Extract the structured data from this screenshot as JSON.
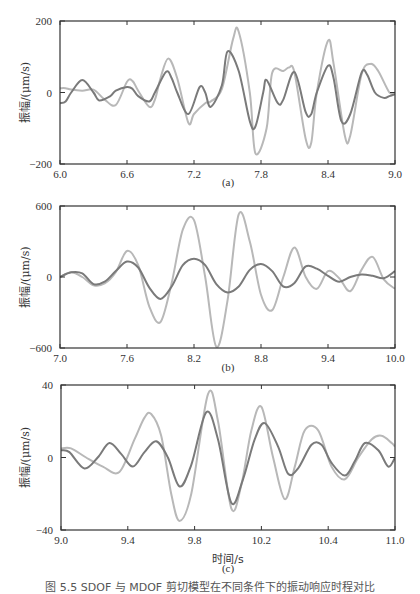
{
  "figure": {
    "caption": "图 5.5  SDOF 与 MDOF 剪切模型在不同条件下的振动响应时程对比",
    "xlabel_shared": "时间/s",
    "colors": {
      "series_dark": "#7a7a7a",
      "series_light": "#b8b8b8",
      "axis": "#333333"
    }
  },
  "chart_data": [
    {
      "type": "line",
      "panel_label": "(a)",
      "title": "",
      "xlabel": "",
      "ylabel": "振幅/(μm/s)",
      "xlim": [
        6.0,
        9.0
      ],
      "ylim": [
        -200,
        200
      ],
      "xticks": [
        6.0,
        6.6,
        7.2,
        7.8,
        8.4,
        9.0
      ],
      "xtick_labels": [
        "6.0",
        "6.6",
        "7.2",
        "7.8",
        "8.4",
        "9.0"
      ],
      "yticks": [
        -200,
        0,
        200
      ],
      "ytick_labels": [
        "-200",
        "0",
        "200"
      ],
      "grid": false,
      "legend": null,
      "series": [
        {
          "name": "dark",
          "x": [
            6.0,
            6.05,
            6.1,
            6.2,
            6.3,
            6.35,
            6.45,
            6.5,
            6.6,
            6.65,
            6.7,
            6.8,
            6.85,
            6.95,
            7.0,
            7.05,
            7.15,
            7.25,
            7.3,
            7.35,
            7.45,
            7.5,
            7.6,
            7.7,
            7.75,
            7.82,
            7.85,
            7.95,
            8.0,
            8.1,
            8.2,
            8.25,
            8.3,
            8.4,
            8.45,
            8.52,
            8.6,
            8.7,
            8.75,
            8.82,
            8.9,
            8.95,
            9.0
          ],
          "y": [
            -30,
            -25,
            0,
            35,
            0,
            -22,
            -10,
            5,
            15,
            10,
            -10,
            -25,
            0,
            58,
            40,
            0,
            -60,
            15,
            0,
            -40,
            20,
            115,
            60,
            -80,
            -95,
            0,
            35,
            -30,
            -20,
            57,
            -55,
            -60,
            0,
            75,
            40,
            -80,
            -60,
            55,
            50,
            0,
            -15,
            -10,
            -5
          ]
        },
        {
          "name": "light",
          "x": [
            6.0,
            6.05,
            6.1,
            6.2,
            6.3,
            6.4,
            6.5,
            6.6,
            6.65,
            6.7,
            6.8,
            6.85,
            6.9,
            6.97,
            7.05,
            7.15,
            7.2,
            7.3,
            7.35,
            7.45,
            7.55,
            7.6,
            7.7,
            7.75,
            7.85,
            7.9,
            8.0,
            8.05,
            8.1,
            8.2,
            8.25,
            8.3,
            8.4,
            8.45,
            8.55,
            8.6,
            8.7,
            8.78,
            8.85,
            8.95,
            9.0
          ],
          "y": [
            12,
            12,
            8,
            5,
            8,
            -20,
            -35,
            30,
            32,
            5,
            -40,
            -20,
            40,
            95,
            40,
            -85,
            -60,
            -30,
            -25,
            10,
            150,
            170,
            0,
            -170,
            -100,
            55,
            60,
            70,
            55,
            -130,
            -140,
            0,
            145,
            80,
            -120,
            -120,
            50,
            80,
            60,
            0,
            0
          ]
        }
      ]
    },
    {
      "type": "line",
      "panel_label": "(b)",
      "title": "",
      "xlabel": "",
      "ylabel": "振幅/(μm/s)",
      "xlim": [
        7.0,
        10.0
      ],
      "ylim": [
        -600,
        600
      ],
      "xticks": [
        7.0,
        7.6,
        8.2,
        8.8,
        9.4,
        10.0
      ],
      "xtick_labels": [
        "7.0",
        "7.6",
        "8.2",
        "8.8",
        "9.4",
        "10.0"
      ],
      "yticks": [
        -600,
        0,
        600
      ],
      "ytick_labels": [
        "-600",
        "0",
        "600"
      ],
      "grid": false,
      "legend": null,
      "series": [
        {
          "name": "dark",
          "x": [
            7.0,
            7.1,
            7.2,
            7.3,
            7.4,
            7.5,
            7.6,
            7.7,
            7.8,
            7.9,
            8.0,
            8.1,
            8.2,
            8.3,
            8.4,
            8.5,
            8.6,
            8.7,
            8.8,
            8.9,
            9.0,
            9.1,
            9.2,
            9.3,
            9.4,
            9.5,
            9.6,
            9.7,
            9.8,
            9.9,
            10.0
          ],
          "y": [
            0,
            40,
            30,
            -60,
            -40,
            50,
            130,
            80,
            -90,
            -185,
            -80,
            100,
            155,
            100,
            -60,
            -130,
            -80,
            60,
            110,
            50,
            -80,
            -50,
            90,
            70,
            10,
            -40,
            0,
            20,
            10,
            -10,
            50
          ]
        },
        {
          "name": "light",
          "x": [
            7.0,
            7.1,
            7.2,
            7.3,
            7.4,
            7.5,
            7.6,
            7.7,
            7.8,
            7.9,
            8.0,
            8.1,
            8.2,
            8.3,
            8.4,
            8.5,
            8.6,
            8.7,
            8.8,
            8.9,
            9.0,
            9.1,
            9.2,
            9.3,
            9.4,
            9.5,
            9.6,
            9.7,
            9.8,
            9.9,
            10.0
          ],
          "y": [
            0,
            40,
            0,
            -70,
            -55,
            40,
            220,
            100,
            -250,
            -380,
            -50,
            400,
            480,
            0,
            -590,
            -200,
            530,
            300,
            -150,
            -280,
            0,
            250,
            0,
            -100,
            50,
            -10,
            -120,
            60,
            170,
            -20,
            -100
          ]
        }
      ]
    },
    {
      "type": "line",
      "panel_label": "(c)",
      "title": "",
      "xlabel": "时间/s",
      "ylabel": "振幅/(μm/s)",
      "xlim": [
        9.0,
        11.0
      ],
      "ylim": [
        -40,
        40
      ],
      "xticks": [
        9.0,
        9.4,
        9.8,
        10.2,
        10.4,
        11.0
      ],
      "xtick_labels": [
        "9.0",
        "9.4",
        "9.8",
        "10.2",
        "10.4",
        "11.0"
      ],
      "yticks": [
        -40,
        0,
        40
      ],
      "ytick_labels": [
        "-40",
        "0",
        "40"
      ],
      "grid": false,
      "legend": null,
      "series": [
        {
          "name": "dark",
          "x": [
            9.0,
            9.05,
            9.14,
            9.22,
            9.29,
            9.36,
            9.43,
            9.5,
            9.57,
            9.64,
            9.71,
            9.78,
            9.87,
            9.94,
            10.02,
            10.09,
            10.16,
            10.22,
            10.3,
            10.36,
            10.42,
            10.5,
            10.56,
            10.62,
            10.7,
            10.76,
            10.82,
            10.9,
            10.96,
            11.0
          ],
          "y": [
            4,
            3,
            -6,
            0,
            8,
            2,
            -5,
            3,
            9,
            0,
            -16,
            -4,
            25,
            10,
            -25,
            -12,
            10,
            19,
            6,
            -9,
            -6,
            7,
            7,
            -3,
            -10,
            -2,
            8,
            4,
            -5,
            0
          ]
        },
        {
          "name": "light",
          "x": [
            9.0,
            9.06,
            9.15,
            9.25,
            9.35,
            9.44,
            9.5,
            9.54,
            9.6,
            9.66,
            9.71,
            9.78,
            9.88,
            9.94,
            10.02,
            10.08,
            10.14,
            10.2,
            10.27,
            10.34,
            10.4,
            10.46,
            10.54,
            10.62,
            10.7,
            10.78,
            10.86,
            10.92,
            10.98,
            11.0
          ],
          "y": [
            5,
            5,
            0,
            -5,
            -8,
            10,
            22,
            24,
            12,
            -20,
            -35,
            -20,
            35,
            20,
            -28,
            -15,
            15,
            28,
            0,
            -23,
            -5,
            15,
            15,
            -5,
            -12,
            0,
            10,
            12,
            8,
            6
          ]
        }
      ]
    }
  ]
}
